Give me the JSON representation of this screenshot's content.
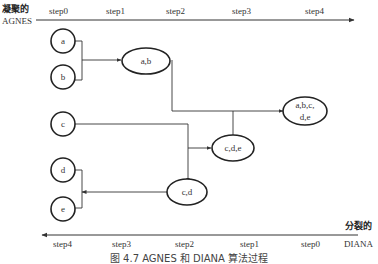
{
  "top_axis": {
    "label_cn": "凝聚的",
    "label_en": "AGNES",
    "steps": [
      "step0",
      "step1",
      "step2",
      "step3",
      "step4"
    ],
    "direction": "right"
  },
  "bottom_axis": {
    "label_cn": "分裂的",
    "label_en": "DIANA",
    "steps": [
      "step4",
      "step3",
      "step2",
      "step1",
      "step0"
    ],
    "direction": "left"
  },
  "nodes": {
    "a": {
      "label": "a"
    },
    "b": {
      "label": "b"
    },
    "c": {
      "label": "c"
    },
    "d": {
      "label": "d"
    },
    "e": {
      "label": "e"
    },
    "ab": {
      "label": "a,b"
    },
    "cd": {
      "label": "c,d"
    },
    "cde": {
      "label": "c,d,e"
    },
    "abcde": {
      "label_line1": "a,b,c,",
      "label_line2": "d,e"
    }
  },
  "merges": [
    {
      "from": [
        "a",
        "b"
      ],
      "to": "ab"
    },
    {
      "from": [
        "d",
        "e"
      ],
      "to": "cd",
      "note": "joined with c"
    },
    {
      "from": [
        "c",
        "cd"
      ],
      "to": "cde"
    },
    {
      "from": [
        "ab",
        "cde"
      ],
      "to": "abcde"
    }
  ],
  "caption": "图 4.7   AGNES 和 DIANA 算法过程"
}
